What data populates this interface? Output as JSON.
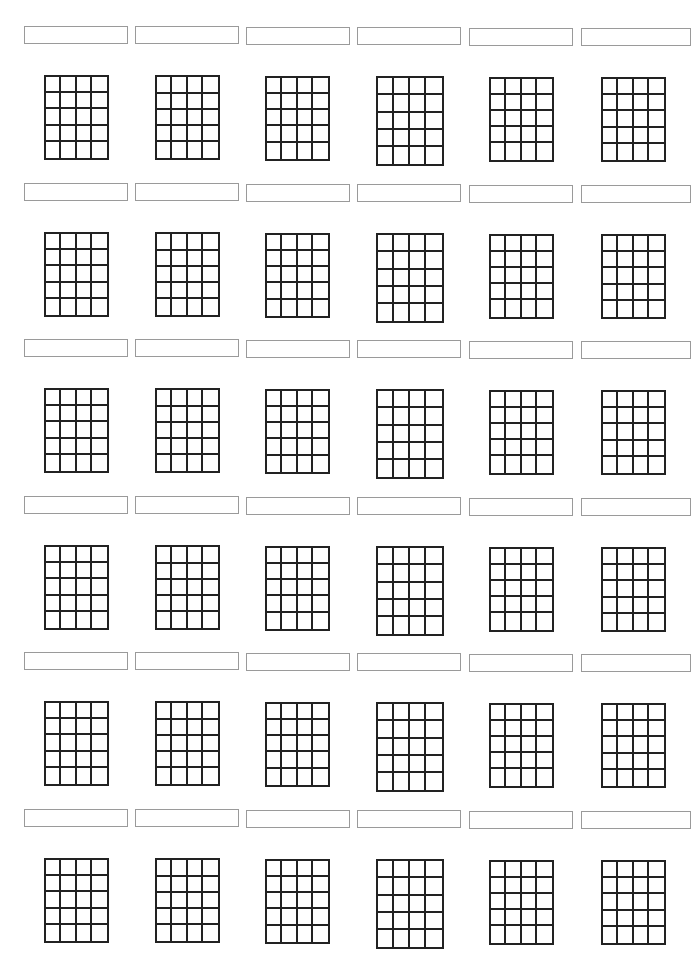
{
  "sheet": {
    "type": "blank guitar chord chart",
    "rows": 6,
    "columns": 6,
    "grid_strings_columns": 4,
    "grid_fret_rows": 5,
    "line_color": "#222222",
    "label_border_color": "#9a9a9a",
    "chord_names": [
      [
        "",
        "",
        "",
        "",
        "",
        ""
      ],
      [
        "",
        "",
        "",
        "",
        "",
        ""
      ],
      [
        "",
        "",
        "",
        "",
        "",
        ""
      ],
      [
        "",
        "",
        "",
        "",
        "",
        ""
      ],
      [
        "",
        "",
        "",
        "",
        "",
        ""
      ],
      [
        "",
        "",
        "",
        "",
        "",
        ""
      ]
    ]
  }
}
